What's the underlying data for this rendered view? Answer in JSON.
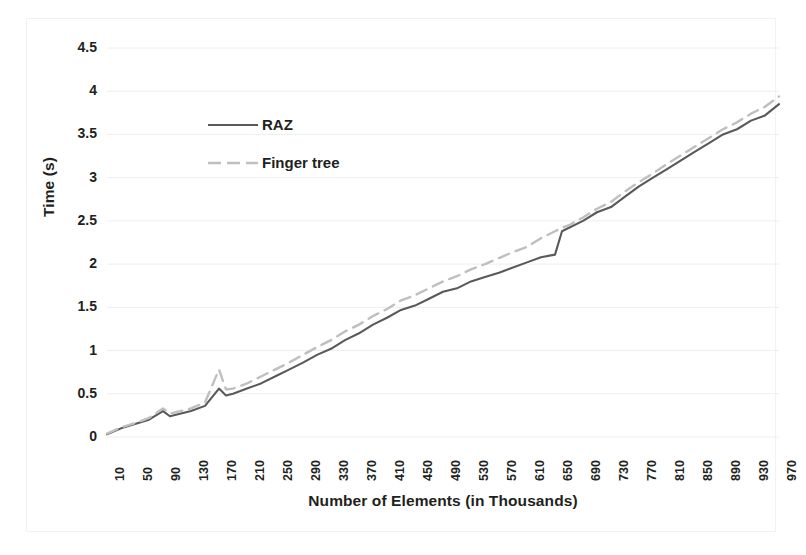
{
  "chart_data": {
    "type": "line",
    "title": "",
    "xlabel": "Number of Elements (in Thousands)",
    "ylabel": "Time (s)",
    "xlim": [
      10,
      970
    ],
    "ylim": [
      0,
      4.5
    ],
    "grid": true,
    "grid_axis": "y",
    "legend_position": "inside-upper-left",
    "xtick_rotation": -90,
    "categories": [
      10,
      50,
      90,
      130,
      170,
      210,
      250,
      290,
      330,
      370,
      410,
      450,
      490,
      530,
      570,
      610,
      650,
      690,
      730,
      770,
      810,
      850,
      890,
      930,
      970
    ],
    "xtick_labels": [
      "10",
      "50",
      "90",
      "130",
      "170",
      "210",
      "250",
      "290",
      "330",
      "370",
      "410",
      "450",
      "490",
      "530",
      "570",
      "610",
      "650",
      "690",
      "730",
      "770",
      "810",
      "850",
      "890",
      "930",
      "970"
    ],
    "ytick_labels": [
      "0",
      "0.5",
      "1",
      "1.5",
      "2",
      "2.5",
      "3",
      "3.5",
      "4",
      "4.5"
    ],
    "ytick_values": [
      0,
      0.5,
      1,
      1.5,
      2,
      2.5,
      3,
      3.5,
      4,
      4.5
    ],
    "series": [
      {
        "name": "RAZ",
        "color": "#595959",
        "style": "solid",
        "x": [
          10,
          30,
          50,
          70,
          90,
          100,
          110,
          130,
          150,
          170,
          180,
          190,
          210,
          230,
          250,
          270,
          290,
          310,
          330,
          350,
          370,
          390,
          410,
          430,
          450,
          470,
          490,
          510,
          530,
          550,
          570,
          590,
          610,
          630,
          650,
          660,
          670,
          690,
          710,
          730,
          750,
          770,
          790,
          810,
          830,
          850,
          870,
          890,
          910,
          930,
          950,
          970
        ],
        "values": [
          0.03,
          0.1,
          0.15,
          0.2,
          0.3,
          0.24,
          0.26,
          0.3,
          0.36,
          0.56,
          0.48,
          0.5,
          0.56,
          0.62,
          0.7,
          0.78,
          0.86,
          0.95,
          1.02,
          1.12,
          1.2,
          1.3,
          1.38,
          1.47,
          1.52,
          1.6,
          1.68,
          1.72,
          1.8,
          1.85,
          1.9,
          1.96,
          2.02,
          2.08,
          2.11,
          2.38,
          2.42,
          2.5,
          2.6,
          2.66,
          2.78,
          2.9,
          3.0,
          3.1,
          3.2,
          3.3,
          3.4,
          3.5,
          3.56,
          3.66,
          3.72,
          3.85
        ]
      },
      {
        "name": "Finger tree",
        "color": "#bfbfbf",
        "style": "dashed",
        "x": [
          10,
          30,
          50,
          70,
          90,
          100,
          110,
          130,
          150,
          170,
          180,
          190,
          210,
          230,
          250,
          270,
          290,
          310,
          330,
          350,
          370,
          390,
          410,
          430,
          450,
          470,
          490,
          510,
          530,
          550,
          570,
          590,
          610,
          630,
          650,
          660,
          670,
          690,
          710,
          730,
          750,
          770,
          790,
          810,
          830,
          850,
          870,
          890,
          910,
          930,
          950,
          970
        ],
        "values": [
          0.04,
          0.11,
          0.16,
          0.22,
          0.33,
          0.27,
          0.29,
          0.33,
          0.4,
          0.78,
          0.55,
          0.56,
          0.62,
          0.7,
          0.78,
          0.86,
          0.95,
          1.04,
          1.12,
          1.22,
          1.3,
          1.4,
          1.48,
          1.58,
          1.64,
          1.72,
          1.8,
          1.86,
          1.94,
          2.0,
          2.07,
          2.14,
          2.2,
          2.3,
          2.38,
          2.42,
          2.45,
          2.54,
          2.64,
          2.72,
          2.84,
          2.95,
          3.05,
          3.16,
          3.26,
          3.36,
          3.46,
          3.56,
          3.64,
          3.74,
          3.82,
          3.94
        ]
      }
    ],
    "annotations": [
      {
        "note": "small spike in both series near x=90"
      },
      {
        "note": "pronounced spike in Finger tree near x=170 reaching ~0.8"
      },
      {
        "note": "series cross near x=655 at ~2.4 s"
      }
    ]
  },
  "legend": {
    "entries": [
      {
        "label": "RAZ",
        "color": "#595959",
        "style": "solid"
      },
      {
        "label": "Finger tree",
        "color": "#bfbfbf",
        "style": "dashed"
      }
    ]
  },
  "colors": {
    "raz": "#595959",
    "finger_tree": "#bfbfbf",
    "gridline": "#eeeeee",
    "text": "#231f20",
    "background": "#ffffff"
  }
}
